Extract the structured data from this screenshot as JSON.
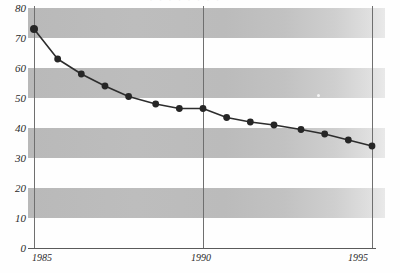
{
  "top_fragment_text": "· · · · · · · ·",
  "colors": {
    "band_fill": "#bcbcbc",
    "line": "#2d2d2d",
    "marker": "#262626",
    "axis": "#5a5a5a",
    "gridline": "#6f6f6f",
    "background": "#fefefe",
    "text": "#2b2b2b"
  },
  "chart_data": {
    "type": "line",
    "title": "",
    "subtitle": "",
    "xlabel": "",
    "ylabel": "",
    "xlim": [
      1985,
      1995
    ],
    "ylim": [
      0,
      80
    ],
    "grid": "horizontal-bands",
    "legend": "none",
    "y_ticks": [
      0,
      10,
      20,
      30,
      40,
      50,
      60,
      70,
      80
    ],
    "y_tick_labels": [
      "0",
      "10",
      "20",
      "30",
      "40",
      "50",
      "60",
      "70",
      "80"
    ],
    "x_ticks": [
      1985,
      1990,
      1995
    ],
    "x_tick_labels": [
      "1985",
      "1990",
      "1995"
    ],
    "shaded_band_ranges": [
      [
        70,
        80
      ],
      [
        50,
        60
      ],
      [
        30,
        40
      ],
      [
        10,
        20
      ]
    ],
    "series": [
      {
        "name": "series-1",
        "marker": "filled-circle",
        "x": [
          1985.0,
          1985.7,
          1986.4,
          1987.1,
          1987.8,
          1988.6,
          1989.3,
          1990.0,
          1990.7,
          1991.4,
          1992.1,
          1992.9,
          1993.6,
          1994.3,
          1995.0
        ],
        "values": [
          73,
          63,
          58,
          54,
          50.5,
          48,
          46.5,
          46.5,
          43.5,
          42,
          41,
          39.5,
          38,
          36,
          34
        ]
      }
    ]
  }
}
